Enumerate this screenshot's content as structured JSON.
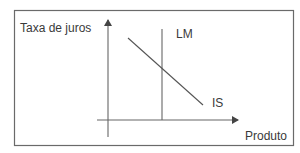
{
  "diagram": {
    "type": "IS-LM",
    "y_axis_label": "Taxa de juros",
    "x_axis_label": "Produto",
    "curves": [
      {
        "name": "LM",
        "label": "LM",
        "orientation": "vertical"
      },
      {
        "name": "IS",
        "label": "IS",
        "orientation": "downward-sloping"
      }
    ],
    "colors": {
      "line": "#555555",
      "text": "#3a3a3a",
      "frame": "#666666",
      "background": "#ffffff"
    }
  }
}
